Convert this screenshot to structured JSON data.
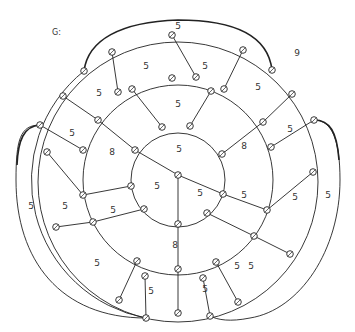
{
  "title": "G:",
  "center_node": [
    178,
    175
  ],
  "rings": [
    {
      "name": "inner",
      "cx": 178,
      "cy": 180,
      "r": 47
    },
    {
      "name": "middle",
      "cx": 178,
      "cy": 180,
      "r": 95
    },
    {
      "name": "outer",
      "cx": 178,
      "cy": 182,
      "r": 140
    }
  ],
  "nodes": {
    "inner": [
      [
        162,
        127
      ],
      [
        190,
        126
      ],
      [
        135,
        150
      ],
      [
        222,
        154
      ],
      [
        131,
        186
      ],
      [
        223,
        194
      ],
      [
        144,
        209
      ],
      [
        207,
        213
      ],
      [
        178,
        224
      ]
    ],
    "middle": [
      [
        118,
        92
      ],
      [
        132,
        89
      ],
      [
        172,
        78
      ],
      [
        196,
        77
      ],
      [
        211,
        91
      ],
      [
        224,
        89
      ],
      [
        98,
        120
      ],
      [
        83,
        150
      ],
      [
        263,
        122
      ],
      [
        271,
        147
      ],
      [
        83,
        195
      ],
      [
        267,
        210
      ],
      [
        93,
        222
      ],
      [
        254,
        236
      ],
      [
        137,
        261
      ],
      [
        216,
        262
      ],
      [
        178,
        269
      ],
      [
        145,
        276
      ],
      [
        203,
        278
      ]
    ],
    "outer": [
      [
        84,
        71
      ],
      [
        112,
        52
      ],
      [
        172,
        35
      ],
      [
        243,
        50
      ],
      [
        272,
        70
      ],
      [
        63,
        96
      ],
      [
        292,
        94
      ],
      [
        40,
        125
      ],
      [
        314,
        120
      ],
      [
        47,
        152
      ],
      [
        313,
        172
      ],
      [
        56,
        227
      ],
      [
        290,
        254
      ],
      [
        119,
        300
      ],
      [
        238,
        302
      ],
      [
        178,
        313
      ],
      [
        146,
        318
      ],
      [
        210,
        316
      ]
    ]
  },
  "edges": [
    [
      [
        178,
        175
      ],
      [
        135,
        150
      ]
    ],
    [
      [
        178,
        175
      ],
      [
        223,
        194
      ]
    ],
    [
      [
        178,
        175
      ],
      [
        178,
        224
      ]
    ],
    [
      [
        162,
        127
      ],
      [
        132,
        89
      ]
    ],
    [
      [
        190,
        126
      ],
      [
        211,
        91
      ]
    ],
    [
      [
        135,
        150
      ],
      [
        98,
        120
      ]
    ],
    [
      [
        222,
        154
      ],
      [
        263,
        122
      ]
    ],
    [
      [
        131,
        186
      ],
      [
        83,
        195
      ]
    ],
    [
      [
        223,
        194
      ],
      [
        267,
        210
      ]
    ],
    [
      [
        144,
        209
      ],
      [
        93,
        222
      ]
    ],
    [
      [
        207,
        213
      ],
      [
        254,
        236
      ]
    ],
    [
      [
        178,
        224
      ],
      [
        178,
        269
      ]
    ],
    [
      [
        118,
        92
      ],
      [
        112,
        52
      ]
    ],
    [
      [
        196,
        77
      ],
      [
        172,
        35
      ]
    ],
    [
      [
        224,
        89
      ],
      [
        243,
        50
      ]
    ],
    [
      [
        98,
        120
      ],
      [
        63,
        96
      ]
    ],
    [
      [
        263,
        122
      ],
      [
        292,
        94
      ]
    ],
    [
      [
        83,
        150
      ],
      [
        40,
        125
      ]
    ],
    [
      [
        271,
        147
      ],
      [
        314,
        120
      ]
    ],
    [
      [
        83,
        195
      ],
      [
        47,
        152
      ]
    ],
    [
      [
        93,
        222
      ],
      [
        56,
        227
      ]
    ],
    [
      [
        267,
        210
      ],
      [
        313,
        172
      ]
    ],
    [
      [
        137,
        261
      ],
      [
        119,
        300
      ]
    ],
    [
      [
        254,
        236
      ],
      [
        290,
        254
      ]
    ],
    [
      [
        178,
        269
      ],
      [
        178,
        313
      ]
    ],
    [
      [
        145,
        276
      ],
      [
        146,
        318
      ]
    ],
    [
      [
        203,
        278
      ],
      [
        210,
        316
      ]
    ],
    [
      [
        216,
        262
      ],
      [
        238,
        302
      ]
    ]
  ],
  "heavy_arcs": [
    {
      "from": [
        84,
        71
      ],
      "to": [
        272,
        70
      ],
      "via": "top"
    },
    {
      "from": [
        40,
        125
      ],
      "to": [
        146,
        318
      ],
      "via": "left"
    },
    {
      "from": [
        314,
        120
      ],
      "to": [
        210,
        316
      ],
      "via": "right"
    }
  ],
  "face_labels": [
    {
      "text": "5",
      "x": 178,
      "y": 26
    },
    {
      "text": "9",
      "x": 297,
      "y": 53
    },
    {
      "text": "5",
      "x": 146,
      "y": 66
    },
    {
      "text": "5",
      "x": 205,
      "y": 66
    },
    {
      "text": "5",
      "x": 99,
      "y": 93
    },
    {
      "text": "5",
      "x": 258,
      "y": 87
    },
    {
      "text": "5",
      "x": 178,
      "y": 104
    },
    {
      "text": "5",
      "x": 72,
      "y": 133
    },
    {
      "text": "5",
      "x": 290,
      "y": 129
    },
    {
      "text": "8",
      "x": 112,
      "y": 152
    },
    {
      "text": "8",
      "x": 244,
      "y": 146
    },
    {
      "text": "5",
      "x": 179,
      "y": 149
    },
    {
      "text": "5",
      "x": 157,
      "y": 186
    },
    {
      "text": "5",
      "x": 200,
      "y": 193
    },
    {
      "text": "5",
      "x": 65,
      "y": 206
    },
    {
      "text": "5",
      "x": 31,
      "y": 206
    },
    {
      "text": "5",
      "x": 113,
      "y": 210
    },
    {
      "text": "5",
      "x": 244,
      "y": 195
    },
    {
      "text": "5",
      "x": 295,
      "y": 197
    },
    {
      "text": "5",
      "x": 328,
      "y": 195
    },
    {
      "text": "8",
      "x": 175,
      "y": 245
    },
    {
      "text": "5",
      "x": 97,
      "y": 263
    },
    {
      "text": "5",
      "x": 251,
      "y": 266
    },
    {
      "text": "5",
      "x": 151,
      "y": 291
    },
    {
      "text": "5",
      "x": 205,
      "y": 289
    },
    {
      "text": "5",
      "x": 237,
      "y": 266
    }
  ],
  "colors": {
    "stroke": "#222222",
    "background": "#ffffff"
  }
}
